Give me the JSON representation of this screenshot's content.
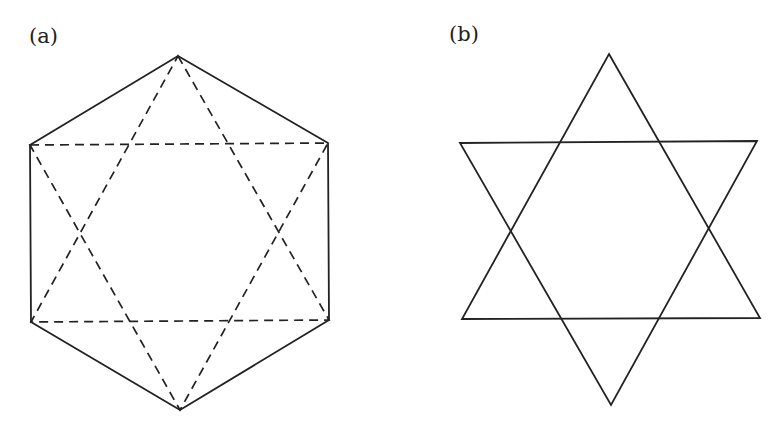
{
  "figures": {
    "a": {
      "label": "(a)",
      "description": "Regular hexagon (solid edges) with inscribed hexagram formed by two dashed equilateral triangles connecting alternate vertices",
      "hexagon_vertices": [
        [
          178,
          56
        ],
        [
          328,
          143
        ],
        [
          329,
          320
        ],
        [
          180,
          410
        ],
        [
          31,
          322
        ],
        [
          30,
          145
        ]
      ],
      "triangle_up": [
        [
          178,
          56
        ],
        [
          329,
          320
        ],
        [
          31,
          322
        ]
      ],
      "triangle_down": [
        [
          30,
          145
        ],
        [
          328,
          143
        ],
        [
          180,
          410
        ]
      ],
      "edge_style": "solid",
      "triangle_style": "dashed"
    },
    "b": {
      "label": "(b)",
      "description": "Hexagram (six-pointed star) formed by two overlapping solid equilateral triangles",
      "triangle_up": [
        [
          609,
          54
        ],
        [
          760,
          318
        ],
        [
          462,
          319
        ]
      ],
      "triangle_down": [
        [
          460,
          143
        ],
        [
          757,
          141
        ],
        [
          611,
          405
        ]
      ],
      "edge_style": "solid"
    }
  },
  "colors": {
    "stroke": "#222222",
    "background": "#ffffff"
  }
}
